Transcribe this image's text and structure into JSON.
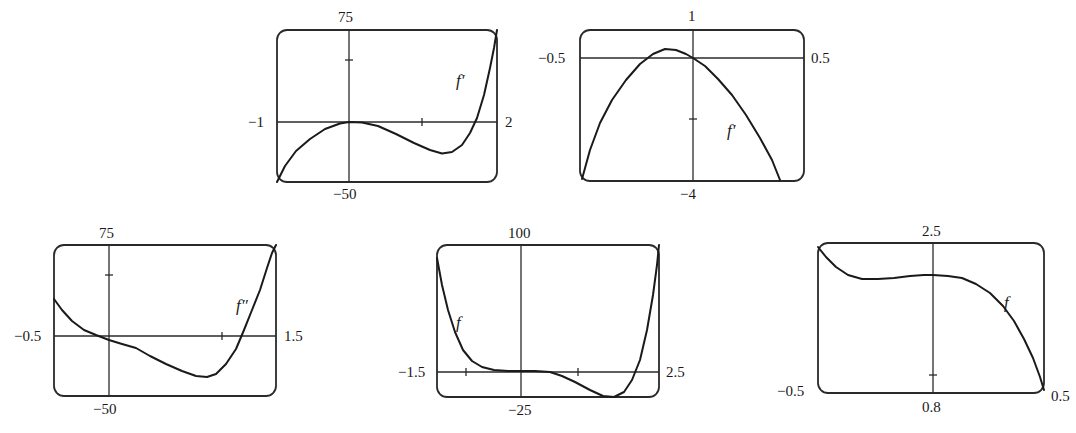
{
  "chart_data": [
    {
      "id": "g1",
      "type": "line",
      "title": "",
      "function_label": "f′",
      "window": {
        "xmin": -1,
        "xmax": 2,
        "ymin": -50,
        "ymax": 75
      },
      "labels": {
        "top": "75",
        "bottom": "−50",
        "left": "−1",
        "right": "2"
      },
      "frame": {
        "x": 277,
        "y": 30,
        "w": 220,
        "h": 152
      },
      "axes": {
        "x_axis_y": 122,
        "y_axis_x": 349
      },
      "ticks": {
        "y": [
          60
        ],
        "x": [
          422
        ]
      },
      "label_pos": {
        "x": 458,
        "y": 80
      },
      "points": [
        [
          277,
          182
        ],
        [
          285,
          166
        ],
        [
          296,
          151
        ],
        [
          310,
          139
        ],
        [
          325,
          129
        ],
        [
          340,
          123.5
        ],
        [
          349,
          122
        ],
        [
          362,
          122.5
        ],
        [
          378,
          126
        ],
        [
          396,
          134
        ],
        [
          414,
          143
        ],
        [
          430,
          150
        ],
        [
          442,
          153.5
        ],
        [
          452,
          152
        ],
        [
          462,
          145
        ],
        [
          470,
          133
        ],
        [
          477,
          118
        ],
        [
          484,
          95
        ],
        [
          490,
          68
        ],
        [
          494,
          48
        ],
        [
          497,
          30
        ]
      ],
      "grid": false
    },
    {
      "id": "g2",
      "type": "line",
      "title": "",
      "function_label": "f′",
      "window": {
        "xmin": -0.5,
        "xmax": 0.5,
        "ymin": -4,
        "ymax": 1
      },
      "labels": {
        "top": "1",
        "bottom": "−4",
        "left": "−0.5",
        "right": "0.5"
      },
      "frame": {
        "x": 580,
        "y": 30,
        "w": 224,
        "h": 151
      },
      "axes": {
        "x_axis_y": 58,
        "y_axis_x": 693
      },
      "ticks": {
        "y": [
          119
        ],
        "x": []
      },
      "label_pos": {
        "x": 728,
        "y": 132
      },
      "points": [
        [
          582,
          179
        ],
        [
          590,
          150
        ],
        [
          600,
          123
        ],
        [
          612,
          100
        ],
        [
          626,
          80
        ],
        [
          640,
          64
        ],
        [
          653,
          54
        ],
        [
          665,
          49
        ],
        [
          676,
          50
        ],
        [
          686,
          54
        ],
        [
          693,
          58
        ],
        [
          705,
          66
        ],
        [
          718,
          79
        ],
        [
          732,
          95
        ],
        [
          746,
          115
        ],
        [
          760,
          138
        ],
        [
          772,
          160
        ],
        [
          780,
          180
        ]
      ],
      "grid": false
    },
    {
      "id": "g3",
      "type": "line",
      "title": "",
      "function_label": "f″",
      "window": {
        "xmin": -0.5,
        "xmax": 1.5,
        "ymin": -50,
        "ymax": 75
      },
      "labels": {
        "top": "75",
        "bottom": "−50",
        "left": "−0.5",
        "right": "1.5"
      },
      "frame": {
        "x": 54,
        "y": 245,
        "w": 222,
        "h": 151
      },
      "axes": {
        "x_axis_y": 336,
        "y_axis_x": 109
      },
      "ticks": {
        "y": [
          275
        ],
        "x": [
          222
        ]
      },
      "label_pos": {
        "x": 236,
        "y": 307
      },
      "points": [
        [
          54,
          299
        ],
        [
          62,
          310
        ],
        [
          72,
          321
        ],
        [
          84,
          330
        ],
        [
          96,
          335
        ],
        [
          109,
          340
        ],
        [
          122,
          344
        ],
        [
          136,
          348
        ],
        [
          150,
          356
        ],
        [
          166,
          364
        ],
        [
          182,
          371
        ],
        [
          196,
          376
        ],
        [
          207,
          377
        ],
        [
          216,
          374
        ],
        [
          226,
          364
        ],
        [
          236,
          349
        ],
        [
          244,
          330
        ],
        [
          252,
          310
        ],
        [
          260,
          290
        ],
        [
          267,
          268
        ],
        [
          272,
          253
        ],
        [
          276,
          245
        ]
      ],
      "grid": false
    },
    {
      "id": "g4",
      "type": "line",
      "title": "",
      "function_label": "f",
      "window": {
        "xmin": -1.5,
        "xmax": 2.5,
        "ymin": -25,
        "ymax": 100
      },
      "labels": {
        "top": "100",
        "bottom": "−25",
        "left": "−1.5",
        "right": "2.5"
      },
      "frame": {
        "x": 437,
        "y": 245,
        "w": 222,
        "h": 152
      },
      "axes": {
        "x_axis_y": 372,
        "y_axis_x": 521
      },
      "ticks": {
        "y": [],
        "x": [
          466,
          578
        ]
      },
      "label_pos": {
        "x": 456,
        "y": 324
      },
      "points": [
        [
          437,
          258
        ],
        [
          442,
          285
        ],
        [
          448,
          310
        ],
        [
          455,
          332
        ],
        [
          463,
          350
        ],
        [
          472,
          361
        ],
        [
          482,
          367
        ],
        [
          494,
          370
        ],
        [
          508,
          371
        ],
        [
          521,
          371
        ],
        [
          535,
          371
        ],
        [
          550,
          372
        ],
        [
          562,
          376
        ],
        [
          575,
          382
        ],
        [
          590,
          390
        ],
        [
          603,
          396
        ],
        [
          614,
          397
        ],
        [
          624,
          392
        ],
        [
          632,
          380
        ],
        [
          640,
          360
        ],
        [
          647,
          330
        ],
        [
          653,
          295
        ],
        [
          657,
          265
        ],
        [
          659,
          245
        ]
      ],
      "grid": false
    },
    {
      "id": "g5",
      "type": "line",
      "title": "",
      "function_label": "f",
      "window": {
        "xmin": -0.5,
        "xmax": 0.5,
        "ymin": 0.8,
        "ymax": 2.5
      },
      "labels": {
        "top": "2.5",
        "bottom": "0.8",
        "left": "−0.5",
        "right": "0.5"
      },
      "frame": {
        "x": 818,
        "y": 243,
        "w": 226,
        "h": 150
      },
      "axes": {
        "x_axis_y": null,
        "y_axis_x": 933
      },
      "ticks": {
        "y": [
          375
        ],
        "x": []
      },
      "label_pos": {
        "x": 1005,
        "y": 306
      },
      "points": [
        [
          818,
          247
        ],
        [
          826,
          257
        ],
        [
          836,
          267
        ],
        [
          848,
          275
        ],
        [
          862,
          279
        ],
        [
          878,
          279
        ],
        [
          894,
          278
        ],
        [
          910,
          276
        ],
        [
          924,
          275
        ],
        [
          933,
          275
        ],
        [
          948,
          276
        ],
        [
          962,
          278
        ],
        [
          976,
          284
        ],
        [
          990,
          293
        ],
        [
          1003,
          306
        ],
        [
          1014,
          321
        ],
        [
          1024,
          339
        ],
        [
          1033,
          358
        ],
        [
          1040,
          377
        ],
        [
          1044,
          390
        ]
      ],
      "grid": false
    }
  ]
}
